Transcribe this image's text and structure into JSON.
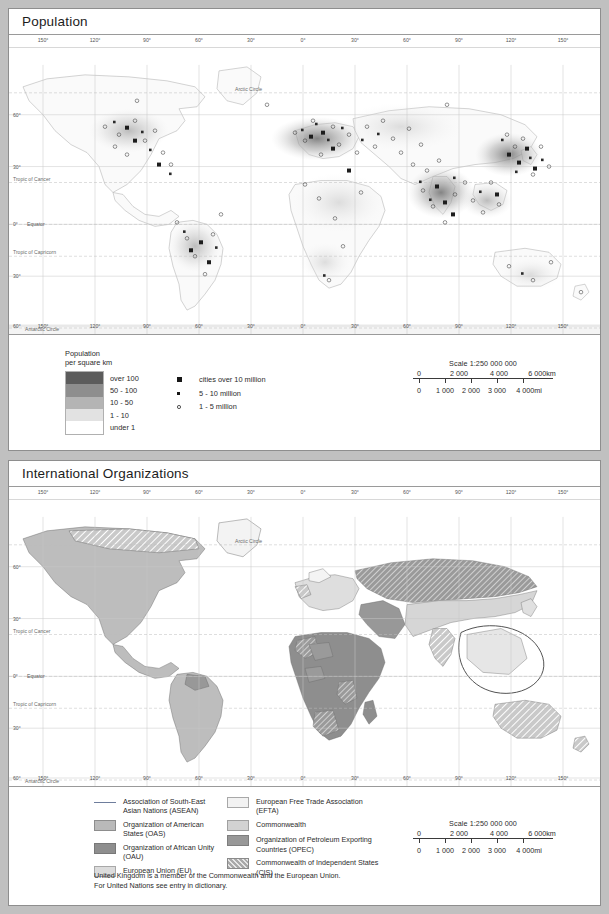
{
  "page": {
    "background_color": "#c0c0c0"
  },
  "panels": [
    {
      "id": "population",
      "title": "Population",
      "scale": {
        "title": "Scale 1:250 000 000",
        "km_labels": [
          "0",
          "2 000",
          "4 000",
          "6 000km"
        ],
        "mi_labels": [
          "0",
          "1 000",
          "2 000",
          "3 000",
          "4 000mi"
        ]
      }
    },
    {
      "id": "international-organizations",
      "title": "International Organizations",
      "scale": {
        "title": "Scale 1:250 000 000",
        "km_labels": [
          "0",
          "2 000",
          "4 000",
          "6 000km"
        ],
        "mi_labels": [
          "0",
          "1 000",
          "2 000",
          "3 000",
          "4 000mi"
        ]
      }
    }
  ],
  "population_legend": {
    "heading_line1": "Population",
    "heading_line2": "per square km",
    "classes": [
      {
        "label": "over 100",
        "color": "#5c5c5c"
      },
      {
        "label": "50 - 100",
        "color": "#8e8e8e"
      },
      {
        "label": "10 - 50",
        "color": "#b4b4b4"
      },
      {
        "label": "1 - 10",
        "color": "#e2e2e2"
      },
      {
        "label": "under 1",
        "color": "#ffffff"
      }
    ],
    "cities": [
      {
        "label": "cities over 10 million",
        "symbol": "square-large"
      },
      {
        "label": "5 - 10 million",
        "symbol": "square-small"
      },
      {
        "label": "1 - 5 million",
        "symbol": "circle-open"
      }
    ]
  },
  "organizations_legend": {
    "left_column": [
      {
        "label": "Association of South-East Asian Nations (ASEAN)",
        "swatch": "line",
        "color": "#6e7d9c"
      },
      {
        "label": "Organization of American States (OAS)",
        "swatch": "fill",
        "color": "#b9b9b9"
      },
      {
        "label": "Organization of African Unity (OAU)",
        "swatch": "fill",
        "color": "#8e8e8e"
      },
      {
        "label": "European Union (EU)",
        "swatch": "fill",
        "color": "#dcdcdc"
      }
    ],
    "right_column": [
      {
        "label": "European Free Trade Association (EFTA)",
        "swatch": "fill",
        "color": "#f2f2f2"
      },
      {
        "label": "Commonwealth",
        "swatch": "fill",
        "color": "#d2d2d2"
      },
      {
        "label": "Organization of Petroleum Exporting Countries (OPEC)",
        "swatch": "fill",
        "color": "#989898"
      },
      {
        "label": "Commonwealth of Independent States (CIS)",
        "swatch": "hatch",
        "color": "#a9a9a9"
      }
    ],
    "footnote_line1": "United Kingdom  is a member of the Commonwealth  and the European Union.",
    "footnote_line2": "For United Nations see entry in dictionary."
  },
  "map_graticule": {
    "longitude_labels": [
      "150°",
      "120°",
      "90°",
      "60°",
      "30°",
      "0°",
      "30°",
      "60°",
      "90°",
      "120°",
      "150°"
    ],
    "latitude_labels": [
      "60°",
      "30°",
      "0°",
      "30°",
      "60°"
    ],
    "named_lines": [
      "Arctic Circle",
      "Tropic of Cancer",
      "Equator",
      "Tropic of Capricorn",
      "Antarctic Circle"
    ],
    "equator_label": "0°  Equator"
  }
}
